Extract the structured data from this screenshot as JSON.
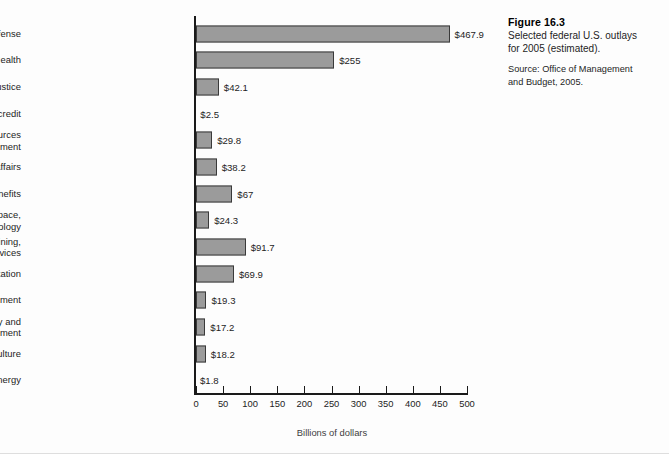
{
  "caption": {
    "figure_number": "Figure 16.3",
    "description_line1": "Selected federal U.S. outlays",
    "description_line2": "for 2005 (estimated).",
    "source_line1": "Source: Office of Management",
    "source_line2": "and Budget, 2005."
  },
  "chart_data": {
    "type": "bar",
    "orientation": "horizontal",
    "title": "Selected federal U.S. outlays for 2005 (estimated)",
    "xlabel": "Billions of dollars",
    "ylabel": "",
    "xlim": [
      0,
      500
    ],
    "xticks": [
      0,
      50,
      100,
      150,
      200,
      250,
      300,
      350,
      400,
      450,
      500
    ],
    "xtick_labels": [
      "0",
      "50",
      "100",
      "150",
      "200",
      "250",
      "300",
      "350",
      "400",
      "450",
      "500"
    ],
    "grid": false,
    "legend": false,
    "bar_color": "#9b9b9b",
    "bar_edge_color": "#3a3a3a",
    "categories": [
      "National defense",
      "Health",
      "Justice",
      "Commerce and housing credit",
      "Natural resources\nand environment",
      "International affairs",
      "Veterans benefits",
      "Science, space,\nand technology",
      "Education, training,\nemployment and social services",
      "Transportation",
      "General government",
      "Community and\nregional development",
      "Agriculture",
      "Energy"
    ],
    "values": [
      467.9,
      255,
      42.1,
      2.5,
      29.8,
      38.2,
      67,
      24.3,
      91.7,
      69.9,
      19.3,
      17.2,
      18.2,
      1.8
    ],
    "value_labels": [
      "$467.9",
      "$255",
      "$42.1",
      "$2.5",
      "$29.8",
      "$38.2",
      "$67",
      "$24.3",
      "$91.7",
      "$69.9",
      "$19.3",
      "$17.2",
      "$18.2",
      "$1.8"
    ]
  }
}
